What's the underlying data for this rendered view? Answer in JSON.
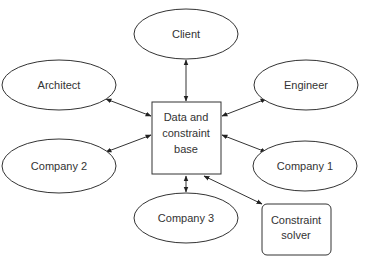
{
  "diagram": {
    "hub": {
      "id": "data-base",
      "lines": [
        "Data and",
        "constraint",
        "base"
      ]
    },
    "nodes": [
      {
        "id": "client",
        "label": "Client",
        "shape": "ellipse"
      },
      {
        "id": "architect",
        "label": "Architect",
        "shape": "ellipse"
      },
      {
        "id": "engineer",
        "label": "Engineer",
        "shape": "ellipse"
      },
      {
        "id": "company-2",
        "label": "Company 2",
        "shape": "ellipse"
      },
      {
        "id": "company-1",
        "label": "Company 1",
        "shape": "ellipse"
      },
      {
        "id": "company-3",
        "label": "Company 3",
        "shape": "ellipse"
      },
      {
        "id": "constraint-solver",
        "lines": [
          "Constraint",
          "solver"
        ],
        "shape": "rounded-rect"
      }
    ],
    "edges": [
      {
        "from": "data-base",
        "to": "client",
        "direction": "both"
      },
      {
        "from": "data-base",
        "to": "architect",
        "direction": "both"
      },
      {
        "from": "data-base",
        "to": "engineer",
        "direction": "both"
      },
      {
        "from": "data-base",
        "to": "company-2",
        "direction": "both"
      },
      {
        "from": "data-base",
        "to": "company-1",
        "direction": "both"
      },
      {
        "from": "data-base",
        "to": "company-3",
        "direction": "both"
      },
      {
        "from": "data-base",
        "to": "constraint-solver",
        "direction": "both"
      }
    ]
  }
}
